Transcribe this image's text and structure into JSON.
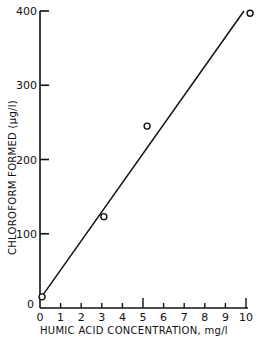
{
  "chart_data": {
    "type": "scatter",
    "title": "",
    "xlabel": "HUMIC ACID CONCENTRATION,  mg/l",
    "ylabel": "CHLOROFORM  FORMED (µg/l)",
    "xlim": [
      0,
      10
    ],
    "ylim": [
      0,
      400
    ],
    "x_ticks": [
      0,
      1,
      2,
      3,
      4,
      5,
      6,
      7,
      8,
      9,
      10
    ],
    "x_tick_labels": [
      "0",
      "1",
      "2",
      "3",
      "4",
      "5",
      "6",
      "7",
      "8",
      "9",
      "10"
    ],
    "x_major_ticks": [
      5,
      10
    ],
    "y_ticks": [
      0,
      100,
      200,
      300,
      400
    ],
    "y_tick_labels": [
      "0",
      "100",
      "200",
      "300",
      "400"
    ],
    "grid": false,
    "legend": null,
    "series": [
      {
        "name": "Measured",
        "marker": "open-circle",
        "x": [
          0.1,
          3.1,
          5.2,
          10.2
        ],
        "y": [
          15,
          123,
          245,
          397
        ]
      },
      {
        "name": "Linear fit",
        "style": "line",
        "x": [
          0,
          9.9
        ],
        "y": [
          12,
          400
        ]
      }
    ]
  }
}
